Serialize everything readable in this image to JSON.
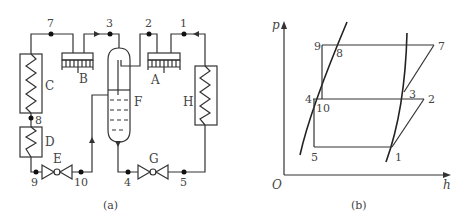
{
  "panel_a": {
    "caption": "(a)",
    "components": {
      "A": "A",
      "B": "B",
      "C": "C",
      "D": "D",
      "E": "E",
      "F": "F",
      "G": "G",
      "H": "H"
    },
    "nodes": {
      "n1": "1",
      "n2": "2",
      "n3": "3",
      "n4": "4",
      "n5": "5",
      "n7": "7",
      "n8": "8",
      "n9": "9",
      "n10": "10"
    }
  },
  "panel_b": {
    "caption": "(b)",
    "axes": {
      "y_label": "p",
      "x_label": "h",
      "origin": "O"
    },
    "points": {
      "p1": "1",
      "p2": "2",
      "p3": "3",
      "p4": "4",
      "p5": "5",
      "p7": "7",
      "p8": "8",
      "p9": "9",
      "p10": "10"
    }
  }
}
